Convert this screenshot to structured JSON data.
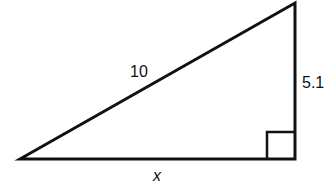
{
  "diagram": {
    "type": "right-triangle",
    "labels": {
      "hypotenuse": "10",
      "vertical_leg": "5.1",
      "horizontal_leg": "x"
    },
    "vertices": {
      "left": [
        20,
        159
      ],
      "top_right": [
        295,
        3
      ],
      "right_angle": [
        295,
        159
      ]
    },
    "right_angle_marker": true,
    "stroke_color": "#111111",
    "background": "#ffffff"
  }
}
